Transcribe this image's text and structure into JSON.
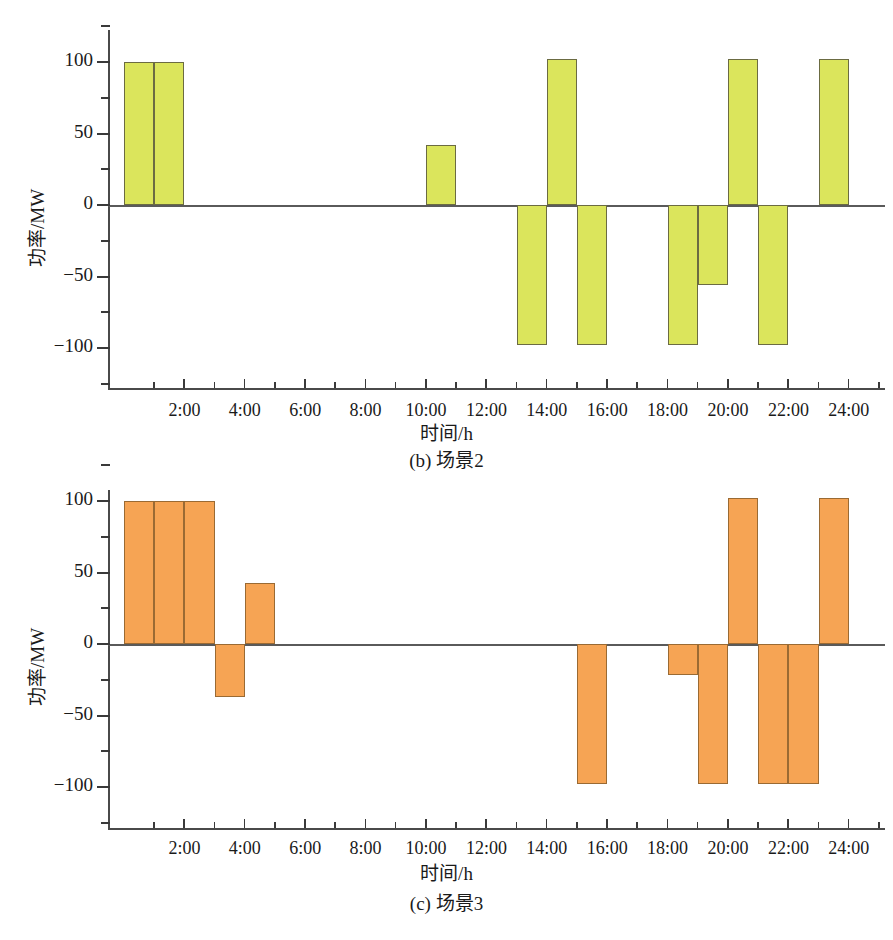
{
  "figure": {
    "axis_title_x": "时间/h",
    "axis_title_y": "功率/MW",
    "captions": {
      "b": "(b) 场景2",
      "c": "(c) 场景3"
    },
    "colors": {
      "green_fill": "#dbe55c",
      "green_edge": "#6b6b42",
      "orange_fill": "#f6a454",
      "orange_edge": "#9a6a33",
      "axis": "#4a4a4a"
    }
  },
  "chart_data": [
    {
      "type": "bar",
      "id": "scenario-2",
      "title": "(b) 场景2",
      "xlabel": "时间/h",
      "ylabel": "功率/MW",
      "series_color": "#dbe55c",
      "xlim": [
        0,
        25
      ],
      "ylim": [
        -125,
        125
      ],
      "ytick_labels": [
        "100",
        "50",
        "0",
        "-50",
        "-100"
      ],
      "ytick_values": [
        100,
        50,
        0,
        -50,
        -100
      ],
      "ytick_minor_values": [
        75,
        25,
        -25,
        -75
      ],
      "xtick_labels": [
        "2:00",
        "4:00",
        "6:00",
        "8:00",
        "10:00",
        "12:00",
        "14:00",
        "16:00",
        "18:00",
        "20:00",
        "22:00",
        "24:00"
      ],
      "xtick_values": [
        2,
        4,
        6,
        8,
        10,
        12,
        14,
        16,
        18,
        20,
        22,
        24
      ],
      "grid": false,
      "bar_width_hours": 1,
      "bars": [
        {
          "hour_start": 0,
          "hour_end": 1,
          "value": 100
        },
        {
          "hour_start": 1,
          "hour_end": 2,
          "value": 100
        },
        {
          "hour_start": 10,
          "hour_end": 11,
          "value": 42
        },
        {
          "hour_start": 13,
          "hour_end": 14,
          "value": -98
        },
        {
          "hour_start": 14,
          "hour_end": 15,
          "value": 102
        },
        {
          "hour_start": 15,
          "hour_end": 16,
          "value": -98
        },
        {
          "hour_start": 18,
          "hour_end": 19,
          "value": -98
        },
        {
          "hour_start": 19,
          "hour_end": 20,
          "value": -56
        },
        {
          "hour_start": 20,
          "hour_end": 21,
          "value": 102
        },
        {
          "hour_start": 21,
          "hour_end": 22,
          "value": -98
        },
        {
          "hour_start": 23,
          "hour_end": 24,
          "value": 102
        }
      ]
    },
    {
      "type": "bar",
      "id": "scenario-3",
      "title": "(c) 场景3",
      "xlabel": "时间/h",
      "ylabel": "功率/MW",
      "series_color": "#f6a454",
      "xlim": [
        0,
        25
      ],
      "ylim": [
        -125,
        125
      ],
      "ytick_labels": [
        "100",
        "50",
        "0",
        "-50",
        "-100"
      ],
      "ytick_values": [
        100,
        50,
        0,
        -50,
        -100
      ],
      "ytick_minor_values": [
        75,
        25,
        -25,
        -75
      ],
      "xtick_labels": [
        "2:00",
        "4:00",
        "6:00",
        "8:00",
        "10:00",
        "12:00",
        "14:00",
        "16:00",
        "18:00",
        "20:00",
        "22:00",
        "24:00"
      ],
      "xtick_values": [
        2,
        4,
        6,
        8,
        10,
        12,
        14,
        16,
        18,
        20,
        22,
        24
      ],
      "grid": false,
      "bar_width_hours": 1,
      "bars": [
        {
          "hour_start": 0,
          "hour_end": 1,
          "value": 100
        },
        {
          "hour_start": 1,
          "hour_end": 2,
          "value": 100
        },
        {
          "hour_start": 2,
          "hour_end": 3,
          "value": 100
        },
        {
          "hour_start": 3,
          "hour_end": 4,
          "value": -37
        },
        {
          "hour_start": 4,
          "hour_end": 5,
          "value": 43
        },
        {
          "hour_start": 15,
          "hour_end": 16,
          "value": -98
        },
        {
          "hour_start": 18,
          "hour_end": 19,
          "value": -22
        },
        {
          "hour_start": 19,
          "hour_end": 20,
          "value": -98
        },
        {
          "hour_start": 20,
          "hour_end": 21,
          "value": 102
        },
        {
          "hour_start": 21,
          "hour_end": 22,
          "value": -98
        },
        {
          "hour_start": 22,
          "hour_end": 23,
          "value": -98
        },
        {
          "hour_start": 23,
          "hour_end": 24,
          "value": 102
        }
      ]
    }
  ]
}
